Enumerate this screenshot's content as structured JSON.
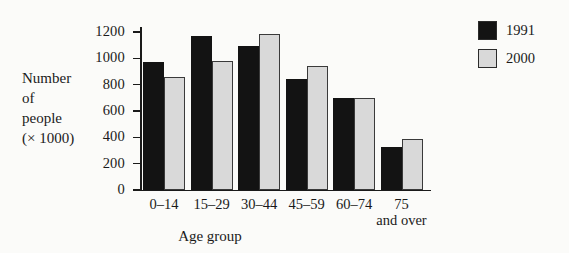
{
  "chart_data": {
    "type": "bar",
    "title": "",
    "xlabel": "Age group",
    "ylabel": "Number of people (× 1000)",
    "ylabel_lines": [
      "Number",
      "of",
      "people",
      "(× 1000)"
    ],
    "categories": [
      "0–14",
      "15–29",
      "30–44",
      "45–59",
      "60–74",
      "75 and over"
    ],
    "category_lines": [
      [
        "0–14"
      ],
      [
        "15–29"
      ],
      [
        "30–44"
      ],
      [
        "45–59"
      ],
      [
        "60–74"
      ],
      [
        "75",
        "and over"
      ]
    ],
    "series": [
      {
        "name": "1991",
        "color": "#131313",
        "values": [
          975,
          1170,
          1090,
          840,
          700,
          330
        ]
      },
      {
        "name": "2000",
        "color": "#d9d9d9",
        "values": [
          855,
          980,
          1185,
          945,
          700,
          385
        ]
      }
    ],
    "ylim": [
      0,
      1300
    ],
    "yticks": [
      0,
      200,
      400,
      600,
      800,
      1000,
      1200
    ],
    "ytick_labels": [
      "0",
      "200",
      "400",
      "600",
      "800",
      "1000",
      "1200"
    ],
    "grid": false,
    "legend_position": "right-top"
  },
  "legend": {
    "entries": [
      {
        "label": "1991",
        "swatch": "black-square"
      },
      {
        "label": "2000",
        "swatch": "light-gray-square"
      }
    ]
  },
  "colors": {
    "series_1991": "#131313",
    "series_2000": "#d9d9d9",
    "axis": "#1a1a1a",
    "background": "#fbfbf9"
  }
}
